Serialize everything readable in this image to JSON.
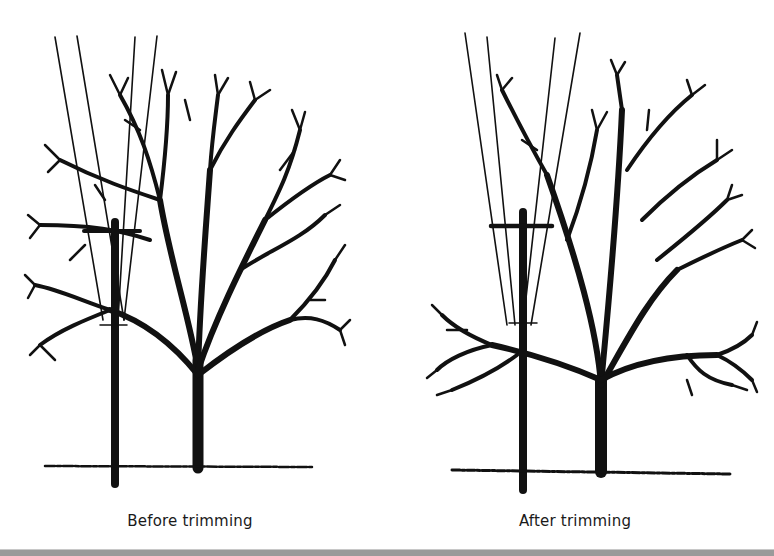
{
  "figure": {
    "panels": [
      {
        "id": "before",
        "caption": "Before trimming"
      },
      {
        "id": "after",
        "caption": "After trimming"
      }
    ],
    "colors": {
      "ink": "#111111",
      "background": "#ffffff",
      "border": "#9a9a9a"
    }
  }
}
